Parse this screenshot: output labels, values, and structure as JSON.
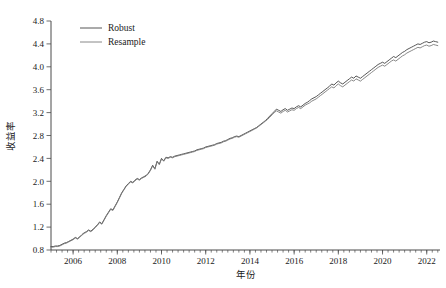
{
  "chart_data": {
    "type": "line",
    "title": "",
    "xlabel": "年份",
    "ylabel": "收益率",
    "xlim": [
      2005.0,
      2022.6
    ],
    "ylim": [
      0.8,
      4.8
    ],
    "grid": false,
    "legend_position": "top-left",
    "xticks": [
      2006,
      2008,
      2010,
      2012,
      2014,
      2016,
      2018,
      2020,
      2022
    ],
    "xtick_labels": [
      "2006",
      "2008",
      "2010",
      "2012",
      "2014",
      "2016",
      "2018",
      "2020",
      "2022"
    ],
    "yticks": [
      0.8,
      1.2,
      1.6,
      2.0,
      2.4,
      2.8,
      3.2,
      3.6,
      4.0,
      4.4,
      4.8
    ],
    "ytick_labels": [
      "0.8",
      "1.2",
      "1.6",
      "2.0",
      "2.4",
      "2.8",
      "3.2",
      "3.6",
      "4.0",
      "4.4",
      "4.8"
    ],
    "x_minor_step": 0.25,
    "colors": {
      "robust": "#444444",
      "resample": "#7a7a7a"
    },
    "x": [
      2005.0,
      2005.1,
      2005.2,
      2005.3,
      2005.4,
      2005.5,
      2005.6,
      2005.7,
      2005.8,
      2005.9,
      2006.0,
      2006.1,
      2006.2,
      2006.3,
      2006.4,
      2006.5,
      2006.6,
      2006.7,
      2006.8,
      2006.9,
      2007.0,
      2007.1,
      2007.2,
      2007.3,
      2007.4,
      2007.5,
      2007.6,
      2007.7,
      2007.8,
      2007.9,
      2008.0,
      2008.1,
      2008.2,
      2008.3,
      2008.4,
      2008.5,
      2008.6,
      2008.7,
      2008.8,
      2008.9,
      2009.0,
      2009.1,
      2009.2,
      2009.3,
      2009.4,
      2009.5,
      2009.6,
      2009.7,
      2009.8,
      2009.9,
      2010.0,
      2010.1,
      2010.2,
      2010.3,
      2010.4,
      2010.5,
      2010.6,
      2010.7,
      2010.8,
      2010.9,
      2011.0,
      2011.1,
      2011.2,
      2011.3,
      2011.4,
      2011.5,
      2011.6,
      2011.7,
      2011.8,
      2011.9,
      2012.0,
      2012.1,
      2012.2,
      2012.3,
      2012.4,
      2012.5,
      2012.6,
      2012.7,
      2012.8,
      2012.9,
      2013.0,
      2013.1,
      2013.2,
      2013.3,
      2013.4,
      2013.5,
      2013.6,
      2013.7,
      2013.8,
      2013.9,
      2014.0,
      2014.1,
      2014.2,
      2014.3,
      2014.4,
      2014.5,
      2014.6,
      2014.7,
      2014.8,
      2014.9,
      2015.0,
      2015.1,
      2015.2,
      2015.3,
      2015.4,
      2015.5,
      2015.6,
      2015.7,
      2015.8,
      2015.9,
      2016.0,
      2016.1,
      2016.2,
      2016.3,
      2016.4,
      2016.5,
      2016.6,
      2016.7,
      2016.8,
      2016.9,
      2017.0,
      2017.1,
      2017.2,
      2017.3,
      2017.4,
      2017.5,
      2017.6,
      2017.7,
      2017.8,
      2017.9,
      2018.0,
      2018.1,
      2018.2,
      2018.3,
      2018.4,
      2018.5,
      2018.6,
      2018.7,
      2018.8,
      2018.9,
      2019.0,
      2019.1,
      2019.2,
      2019.3,
      2019.4,
      2019.5,
      2019.6,
      2019.7,
      2019.8,
      2019.9,
      2020.0,
      2020.1,
      2020.2,
      2020.3,
      2020.4,
      2020.5,
      2020.6,
      2020.7,
      2020.8,
      2020.9,
      2021.0,
      2021.1,
      2021.2,
      2021.3,
      2021.4,
      2021.5,
      2021.6,
      2021.7,
      2021.8,
      2021.9,
      2022.0,
      2022.1,
      2022.2,
      2022.3,
      2022.4,
      2022.5
    ],
    "series": [
      {
        "name": "Robust",
        "color": "#444444",
        "values": [
          0.86,
          0.86,
          0.87,
          0.87,
          0.88,
          0.9,
          0.92,
          0.93,
          0.95,
          0.97,
          0.99,
          1.02,
          1.0,
          1.03,
          1.07,
          1.1,
          1.12,
          1.15,
          1.13,
          1.16,
          1.2,
          1.24,
          1.29,
          1.26,
          1.33,
          1.4,
          1.46,
          1.52,
          1.5,
          1.57,
          1.64,
          1.72,
          1.8,
          1.86,
          1.92,
          1.96,
          2.0,
          1.98,
          2.02,
          2.05,
          2.03,
          2.06,
          2.08,
          2.1,
          2.14,
          2.2,
          2.28,
          2.22,
          2.35,
          2.3,
          2.4,
          2.36,
          2.42,
          2.41,
          2.43,
          2.42,
          2.44,
          2.45,
          2.46,
          2.47,
          2.48,
          2.49,
          2.5,
          2.51,
          2.52,
          2.53,
          2.55,
          2.56,
          2.57,
          2.58,
          2.6,
          2.61,
          2.62,
          2.63,
          2.64,
          2.66,
          2.67,
          2.68,
          2.7,
          2.71,
          2.73,
          2.75,
          2.76,
          2.78,
          2.79,
          2.78,
          2.8,
          2.82,
          2.84,
          2.86,
          2.88,
          2.9,
          2.92,
          2.94,
          2.97,
          3.0,
          3.03,
          3.06,
          3.1,
          3.14,
          3.18,
          3.22,
          3.26,
          3.24,
          3.22,
          3.25,
          3.27,
          3.24,
          3.26,
          3.28,
          3.27,
          3.3,
          3.32,
          3.3,
          3.33,
          3.36,
          3.38,
          3.41,
          3.44,
          3.46,
          3.48,
          3.51,
          3.54,
          3.57,
          3.6,
          3.63,
          3.66,
          3.7,
          3.68,
          3.72,
          3.75,
          3.72,
          3.7,
          3.73,
          3.76,
          3.79,
          3.82,
          3.8,
          3.84,
          3.82,
          3.8,
          3.83,
          3.86,
          3.89,
          3.92,
          3.95,
          3.98,
          4.01,
          4.04,
          4.06,
          4.08,
          4.06,
          4.09,
          4.12,
          4.15,
          4.18,
          4.16,
          4.19,
          4.22,
          4.25,
          4.27,
          4.3,
          4.32,
          4.34,
          4.36,
          4.38,
          4.4,
          4.39,
          4.41,
          4.43,
          4.44,
          4.42,
          4.43,
          4.45,
          4.44,
          4.43
        ]
      },
      {
        "name": "Resample",
        "color": "#7a7a7a",
        "values": [
          0.85,
          0.85,
          0.86,
          0.86,
          0.87,
          0.89,
          0.91,
          0.92,
          0.94,
          0.96,
          0.98,
          1.01,
          0.99,
          1.02,
          1.06,
          1.09,
          1.11,
          1.14,
          1.12,
          1.15,
          1.19,
          1.23,
          1.28,
          1.25,
          1.32,
          1.39,
          1.45,
          1.51,
          1.49,
          1.56,
          1.63,
          1.71,
          1.79,
          1.85,
          1.91,
          1.95,
          1.99,
          1.97,
          2.01,
          2.04,
          2.02,
          2.05,
          2.07,
          2.09,
          2.13,
          2.19,
          2.27,
          2.21,
          2.34,
          2.29,
          2.39,
          2.35,
          2.41,
          2.4,
          2.42,
          2.41,
          2.43,
          2.44,
          2.45,
          2.46,
          2.47,
          2.48,
          2.49,
          2.5,
          2.51,
          2.52,
          2.54,
          2.55,
          2.56,
          2.57,
          2.59,
          2.6,
          2.61,
          2.62,
          2.63,
          2.65,
          2.66,
          2.67,
          2.69,
          2.7,
          2.72,
          2.74,
          2.75,
          2.77,
          2.78,
          2.77,
          2.79,
          2.81,
          2.83,
          2.85,
          2.87,
          2.89,
          2.91,
          2.93,
          2.96,
          2.99,
          3.02,
          3.05,
          3.08,
          3.12,
          3.16,
          3.2,
          3.23,
          3.21,
          3.19,
          3.22,
          3.24,
          3.21,
          3.23,
          3.25,
          3.24,
          3.27,
          3.29,
          3.27,
          3.3,
          3.33,
          3.35,
          3.37,
          3.4,
          3.42,
          3.44,
          3.47,
          3.5,
          3.53,
          3.56,
          3.59,
          3.62,
          3.65,
          3.63,
          3.67,
          3.7,
          3.67,
          3.65,
          3.68,
          3.71,
          3.74,
          3.77,
          3.75,
          3.79,
          3.77,
          3.75,
          3.78,
          3.81,
          3.84,
          3.87,
          3.9,
          3.93,
          3.96,
          3.99,
          4.01,
          4.03,
          4.01,
          4.04,
          4.07,
          4.1,
          4.12,
          4.1,
          4.13,
          4.16,
          4.19,
          4.21,
          4.24,
          4.26,
          4.28,
          4.3,
          4.32,
          4.34,
          4.33,
          4.35,
          4.37,
          4.38,
          4.36,
          4.37,
          4.39,
          4.38,
          4.37
        ]
      }
    ]
  }
}
